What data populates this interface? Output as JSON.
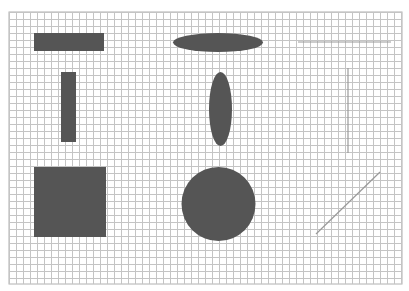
{
  "canvas": {
    "width": 409,
    "height": 291,
    "background": "#ffffff",
    "grid": {
      "x": 9,
      "y": 12,
      "width": 393,
      "height": 272,
      "cell": 7,
      "line_color": "#c4c4c4",
      "major_color": "#b0b0b0"
    }
  },
  "colors": {
    "shape_fill": "#555555",
    "line_stroke": "#9a9a9a"
  },
  "shapes": [
    {
      "id": "horizontal-rectangle",
      "type": "rect",
      "x": 34,
      "y": 33,
      "w": 70,
      "h": 18
    },
    {
      "id": "vertical-rectangle",
      "type": "rect",
      "x": 61,
      "y": 72,
      "w": 15,
      "h": 70
    },
    {
      "id": "square",
      "type": "rect",
      "x": 34,
      "y": 167,
      "w": 72,
      "h": 70
    },
    {
      "id": "horizontal-ellipse",
      "type": "ellipse",
      "cx": 218,
      "cy": 42.5,
      "rx": 45,
      "ry": 9.5
    },
    {
      "id": "vertical-ellipse",
      "type": "ellipse",
      "cx": 220.5,
      "cy": 109,
      "rx": 11.5,
      "ry": 37
    },
    {
      "id": "circle",
      "type": "circle",
      "cx": 218.5,
      "cy": 204,
      "r": 37
    },
    {
      "id": "horizontal-line",
      "type": "line",
      "x1": 298,
      "y1": 42,
      "x2": 391,
      "y2": 42
    },
    {
      "id": "vertical-line",
      "type": "line",
      "x1": 348,
      "y1": 68,
      "x2": 348,
      "y2": 153
    },
    {
      "id": "diagonal-line",
      "type": "line",
      "x1": 316,
      "y1": 234,
      "x2": 380,
      "y2": 172
    }
  ]
}
